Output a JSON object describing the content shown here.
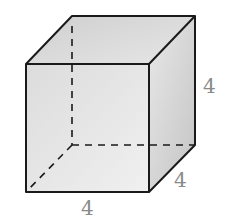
{
  "diagram": {
    "shape": "cube",
    "labels": {
      "height": "4",
      "depth": "4",
      "width": "4"
    },
    "colors": {
      "edge": "#1a1a1a",
      "label": "#8a8a8a",
      "front_face": "#e4e4e4",
      "top_face": "#d6d6d6",
      "right_face": "#cfcfcf"
    }
  }
}
